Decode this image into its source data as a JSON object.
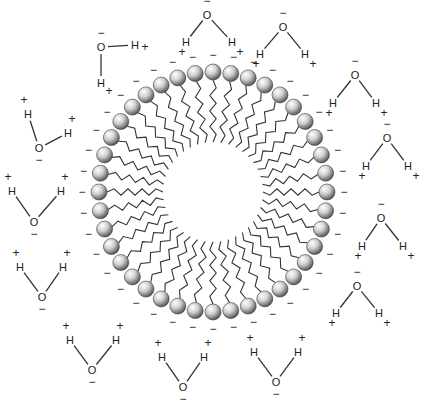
{
  "diagram": {
    "colors": {
      "head_highlight": "#ffffff",
      "head_mid": "#c8c8c8",
      "head_shadow": "#555555",
      "line": "#333333",
      "text": "#222222"
    },
    "micelle": {
      "center": [
        213,
        192
      ],
      "head_radius": 8,
      "rx": 114,
      "ry": 120,
      "inner_rx": 50,
      "inner_ry": 50,
      "head_count": 40,
      "head_charge": "−"
    },
    "labels": {
      "oxygen": "O",
      "hydrogen": "H",
      "negative": "−",
      "positive": "+"
    },
    "water_molecules": [
      {
        "id": "w1",
        "o": [
          207,
          15
        ],
        "h1": [
          186,
          42
        ],
        "h2": [
          232,
          42
        ],
        "orient": "down"
      },
      {
        "id": "w2",
        "o": [
          283,
          27
        ],
        "h1": [
          260,
          54
        ],
        "h2": [
          305,
          54
        ],
        "orient": "down"
      },
      {
        "id": "w3",
        "o": [
          101,
          47
        ],
        "h1": [
          101,
          83
        ],
        "h2": [
          135,
          45
        ],
        "orient": "L"
      },
      {
        "id": "w4",
        "o": [
          355,
          75
        ],
        "h1": [
          333,
          103
        ],
        "h2": [
          376,
          103
        ],
        "orient": "down"
      },
      {
        "id": "w5",
        "o": [
          387,
          138
        ],
        "h1": [
          366,
          166
        ],
        "h2": [
          408,
          166
        ],
        "orient": "down"
      },
      {
        "id": "w6",
        "o": [
          39,
          148
        ],
        "h1": [
          28,
          114
        ],
        "h2": [
          68,
          133
        ],
        "orient": "bent"
      },
      {
        "id": "w7",
        "o": [
          34,
          222
        ],
        "h1": [
          12,
          191
        ],
        "h2": [
          61,
          191
        ],
        "orient": "up"
      },
      {
        "id": "w8",
        "o": [
          381,
          218
        ],
        "h1": [
          362,
          246
        ],
        "h2": [
          403,
          246
        ],
        "orient": "down"
      },
      {
        "id": "w9",
        "o": [
          42,
          297
        ],
        "h1": [
          20,
          267
        ],
        "h2": [
          63,
          267
        ],
        "orient": "up"
      },
      {
        "id": "w10",
        "o": [
          357,
          286
        ],
        "h1": [
          336,
          313
        ],
        "h2": [
          379,
          313
        ],
        "orient": "down"
      },
      {
        "id": "w11",
        "o": [
          92,
          370
        ],
        "h1": [
          70,
          340
        ],
        "h2": [
          116,
          340
        ],
        "orient": "up"
      },
      {
        "id": "w12",
        "o": [
          183,
          387
        ],
        "h1": [
          162,
          357
        ],
        "h2": [
          204,
          357
        ],
        "orient": "up"
      },
      {
        "id": "w13",
        "o": [
          276,
          382
        ],
        "h1": [
          254,
          352
        ],
        "h2": [
          298,
          352
        ],
        "orient": "up"
      }
    ]
  }
}
